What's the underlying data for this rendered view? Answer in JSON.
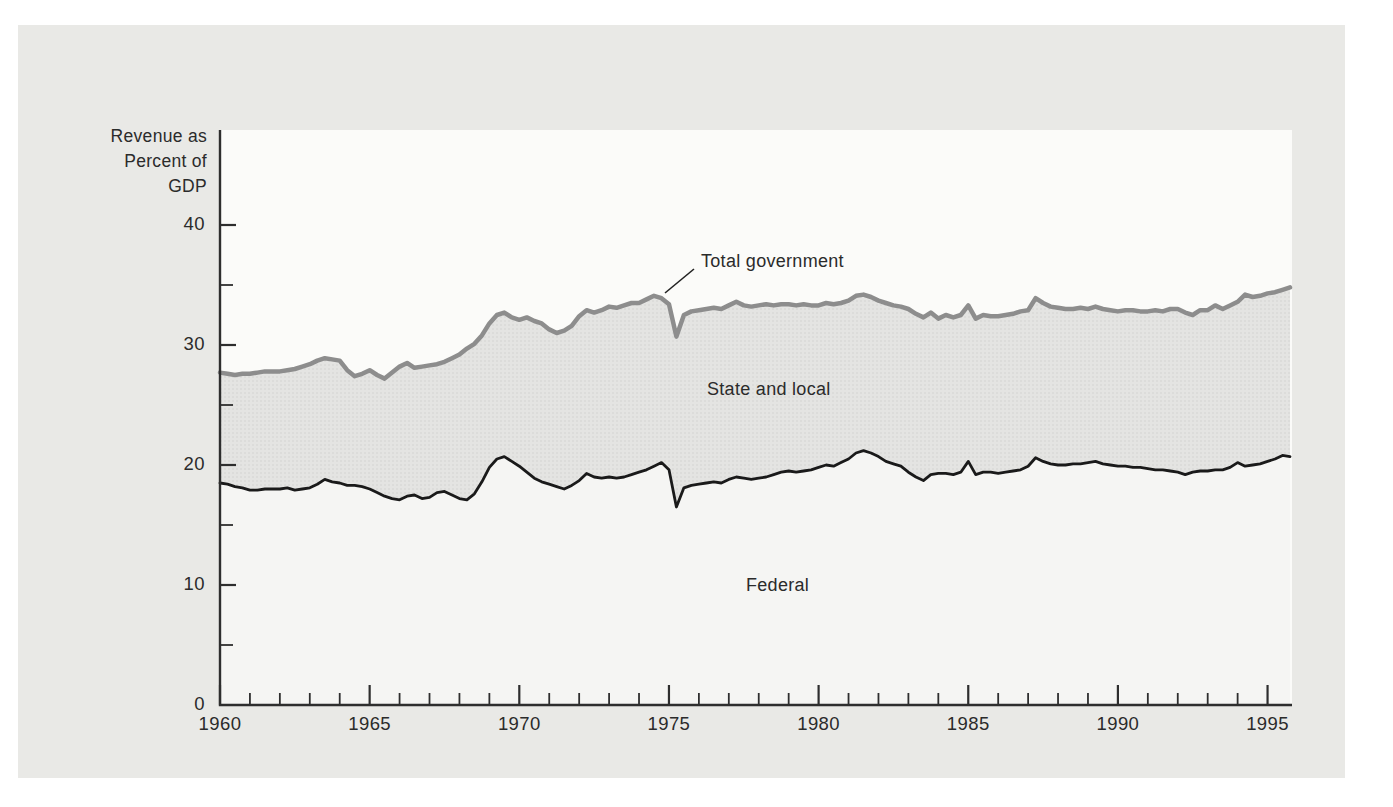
{
  "figure": {
    "y_axis_title_lines": [
      "Revenue as",
      "Percent of",
      "GDP"
    ],
    "labels": {
      "total_government": "Total government",
      "state_and_local": "State and local",
      "federal": "Federal"
    }
  },
  "chart_data": {
    "type": "area",
    "title": "",
    "x_axis": {
      "start": 1960,
      "step": 0.25,
      "count": 144,
      "range": [
        1960,
        1995.75
      ],
      "labeled_ticks": [
        1960,
        1965,
        1970,
        1975,
        1980,
        1985,
        1990,
        1995
      ],
      "minor_tick_every_years": 1
    },
    "y_axis": {
      "major_ticks": [
        0,
        10,
        20,
        30,
        40
      ],
      "minor_ticks": [
        5,
        15,
        25,
        35
      ],
      "visible_range": [
        0,
        47.9
      ],
      "grid": false
    },
    "series": [
      {
        "name": "Total government",
        "color": "#8d8d8d",
        "values": [
          27.7,
          27.6,
          27.5,
          27.6,
          27.6,
          27.7,
          27.8,
          27.8,
          27.8,
          27.9,
          28.0,
          28.2,
          28.4,
          28.7,
          28.9,
          28.8,
          28.7,
          27.9,
          27.4,
          27.6,
          27.9,
          27.5,
          27.2,
          27.7,
          28.2,
          28.5,
          28.1,
          28.2,
          28.3,
          28.4,
          28.6,
          28.9,
          29.2,
          29.7,
          30.1,
          30.8,
          31.8,
          32.5,
          32.7,
          32.3,
          32.1,
          32.3,
          32.0,
          31.8,
          31.3,
          31.0,
          31.2,
          31.6,
          32.4,
          32.9,
          32.7,
          32.9,
          33.2,
          33.1,
          33.3,
          33.5,
          33.5,
          33.8,
          34.1,
          33.9,
          33.4,
          30.7,
          32.5,
          32.8,
          32.9,
          33.0,
          33.1,
          33.0,
          33.3,
          33.6,
          33.3,
          33.2,
          33.3,
          33.4,
          33.3,
          33.4,
          33.4,
          33.3,
          33.4,
          33.3,
          33.3,
          33.5,
          33.4,
          33.5,
          33.7,
          34.1,
          34.2,
          34.0,
          33.7,
          33.5,
          33.3,
          33.2,
          33.0,
          32.6,
          32.3,
          32.7,
          32.2,
          32.5,
          32.3,
          32.5,
          33.3,
          32.2,
          32.5,
          32.4,
          32.4,
          32.5,
          32.6,
          32.8,
          32.9,
          33.9,
          33.5,
          33.2,
          33.1,
          33.0,
          33.0,
          33.1,
          33.0,
          33.2,
          33.0,
          32.9,
          32.8,
          32.9,
          32.9,
          32.8,
          32.8,
          32.9,
          32.8,
          33.0,
          33.0,
          32.7,
          32.5,
          32.9,
          32.9,
          33.3,
          33.0,
          33.3,
          33.6,
          34.2,
          34.0,
          34.1,
          34.3,
          34.4,
          34.6,
          34.8
        ]
      },
      {
        "name": "Federal",
        "color": "#1a1a1a",
        "values": [
          18.5,
          18.4,
          18.2,
          18.1,
          17.9,
          17.9,
          18.0,
          18.0,
          18.0,
          18.1,
          17.9,
          18.0,
          18.1,
          18.4,
          18.8,
          18.6,
          18.5,
          18.3,
          18.3,
          18.2,
          18.0,
          17.7,
          17.4,
          17.2,
          17.1,
          17.4,
          17.5,
          17.2,
          17.3,
          17.7,
          17.8,
          17.5,
          17.2,
          17.1,
          17.6,
          18.6,
          19.8,
          20.5,
          20.7,
          20.3,
          19.9,
          19.4,
          18.9,
          18.6,
          18.4,
          18.2,
          18.0,
          18.3,
          18.7,
          19.3,
          19.0,
          18.9,
          19.0,
          18.9,
          19.0,
          19.2,
          19.4,
          19.6,
          19.9,
          20.2,
          19.6,
          16.5,
          18.1,
          18.3,
          18.4,
          18.5,
          18.6,
          18.5,
          18.8,
          19.0,
          18.9,
          18.8,
          18.9,
          19.0,
          19.2,
          19.4,
          19.5,
          19.4,
          19.5,
          19.6,
          19.8,
          20.0,
          19.9,
          20.2,
          20.5,
          21.0,
          21.2,
          21.0,
          20.7,
          20.3,
          20.1,
          19.9,
          19.4,
          19.0,
          18.7,
          19.2,
          19.3,
          19.3,
          19.2,
          19.4,
          20.3,
          19.2,
          19.4,
          19.4,
          19.3,
          19.4,
          19.5,
          19.6,
          19.9,
          20.6,
          20.3,
          20.1,
          20.0,
          20.0,
          20.1,
          20.1,
          20.2,
          20.3,
          20.1,
          20.0,
          19.9,
          19.9,
          19.8,
          19.8,
          19.7,
          19.6,
          19.6,
          19.5,
          19.4,
          19.2,
          19.4,
          19.5,
          19.5,
          19.6,
          19.6,
          19.8,
          20.2,
          19.9,
          20.0,
          20.1,
          20.3,
          20.5,
          20.8,
          20.7
        ]
      }
    ],
    "regions": [
      {
        "label": "State and local",
        "between": [
          "Federal",
          "Total government"
        ],
        "fill": "#e4e4e2"
      },
      {
        "label": "Federal",
        "below": "Federal",
        "fill": "#f5f5f3"
      }
    ],
    "annotation": {
      "text": "Total government",
      "points_to_series": "Total government"
    },
    "colors": {
      "page_bg": "#e9e9e6",
      "plot_bg": "#fbfbf9",
      "axis": "#2e2e2e",
      "band_dot": "#d0d0ce",
      "text": "#2b2b2b"
    },
    "legend": "labels placed inside plot areas, no legend box"
  }
}
